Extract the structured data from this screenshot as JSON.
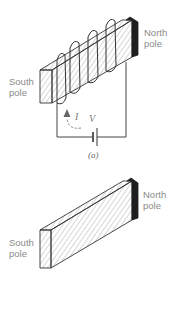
{
  "figure": {
    "panel_a": {
      "caption": "(a)",
      "north_label": [
        "North",
        "pole"
      ],
      "south_label": [
        "South",
        "pole"
      ],
      "current_symbol": "I",
      "voltage_symbol": "V",
      "description": "Bar with coil of wire wound around it, connected to battery"
    },
    "panel_b": {
      "north_label": [
        "North",
        "pole"
      ],
      "south_label": [
        "South",
        "pole"
      ],
      "description": "Magnetized bar without coil"
    }
  },
  "colors": {
    "line": "#333333",
    "hatch": "#9a9a9a",
    "north_end": "#1e1e1e",
    "label": "#8a8a8a"
  }
}
